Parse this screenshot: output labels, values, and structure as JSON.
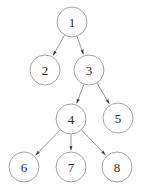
{
  "diagram": {
    "background_color": "#ffffff",
    "node_fill": "#ffffff",
    "node_stroke": "#9a9a9a",
    "edge_color": "#8c8c8c",
    "arrow_color": "#3a3a3a",
    "label_color": "#2b2b2b",
    "node_radius": 15,
    "nodes": [
      {
        "id": "1",
        "label": "1",
        "cx": 72,
        "cy": 22
      },
      {
        "id": "2",
        "label": "2",
        "cx": 45,
        "cy": 70
      },
      {
        "id": "3",
        "label": "3",
        "cx": 89,
        "cy": 70
      },
      {
        "id": "4",
        "label": "4",
        "cx": 71,
        "cy": 119
      },
      {
        "id": "5",
        "label": "5",
        "cx": 118,
        "cy": 118
      },
      {
        "id": "6",
        "label": "6",
        "cx": 24,
        "cy": 167
      },
      {
        "id": "7",
        "label": "7",
        "cx": 71,
        "cy": 167
      },
      {
        "id": "8",
        "label": "8",
        "cx": 117,
        "cy": 167
      }
    ],
    "edges": [
      {
        "from": "1",
        "to": "2",
        "directed": true
      },
      {
        "from": "1",
        "to": "3",
        "directed": true
      },
      {
        "from": "3",
        "to": "4",
        "directed": true
      },
      {
        "from": "3",
        "to": "5",
        "directed": true
      },
      {
        "from": "4",
        "to": "6",
        "directed": true
      },
      {
        "from": "4",
        "to": "7",
        "directed": true
      },
      {
        "from": "4",
        "to": "8",
        "directed": true
      }
    ]
  }
}
